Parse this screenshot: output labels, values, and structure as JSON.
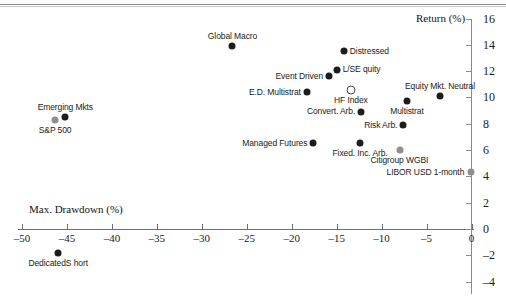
{
  "chart_data": {
    "type": "scatter",
    "title": "",
    "xlabel": "Max. Drawdown (%)",
    "ylabel": "Return (%)",
    "xlim": [
      -52,
      1
    ],
    "ylim": [
      -4,
      16
    ],
    "xticks": [
      -50,
      -45,
      -40,
      -35,
      -30,
      -25,
      -20,
      -15,
      -10,
      -5,
      0
    ],
    "yticks": [
      -4,
      -2,
      0,
      2,
      4,
      6,
      8,
      10,
      12,
      14,
      16
    ],
    "grid": false,
    "legend": "none",
    "y_axis_position": "right",
    "points": [
      {
        "label": "Global Macro",
        "x": -26.6,
        "y": 13.9,
        "marker": "black",
        "label_pos": "above"
      },
      {
        "label": "Distressed",
        "x": -14.2,
        "y": 13.5,
        "marker": "black",
        "label_pos": "right"
      },
      {
        "label": "L/SE quity",
        "x": -15.0,
        "y": 12.1,
        "marker": "black",
        "label_pos": "right"
      },
      {
        "label": "Event Driven",
        "x": -15.9,
        "y": 11.6,
        "marker": "black",
        "label_pos": "left"
      },
      {
        "label": "Equity Mkt. Neutral",
        "x": -3.5,
        "y": 10.1,
        "marker": "black",
        "label_pos": "above"
      },
      {
        "label": "E.D. Multistrat",
        "x": -18.3,
        "y": 10.4,
        "marker": "black",
        "label_pos": "left"
      },
      {
        "label": "HF Index",
        "x": -13.4,
        "y": 10.6,
        "marker": "hollow",
        "label_pos": "below"
      },
      {
        "label": "Multistrat",
        "x": -7.2,
        "y": 9.7,
        "marker": "black",
        "label_pos": "below"
      },
      {
        "label": "Convert. Arb.",
        "x": -12.3,
        "y": 8.9,
        "marker": "black",
        "label_pos": "left"
      },
      {
        "label": "Emerging Mkts",
        "x": -45.2,
        "y": 8.5,
        "marker": "black",
        "label_pos": "above"
      },
      {
        "label": "S&P 500",
        "x": -46.3,
        "y": 8.3,
        "marker": "gray",
        "label_pos": "below"
      },
      {
        "label": "Risk Arb.",
        "x": -7.6,
        "y": 7.9,
        "marker": "black",
        "label_pos": "left"
      },
      {
        "label": "Managed Futures",
        "x": -17.6,
        "y": 6.5,
        "marker": "black",
        "label_pos": "left"
      },
      {
        "label": "Fixed. Inc. Arb.",
        "x": -12.4,
        "y": 6.5,
        "marker": "black",
        "label_pos": "below"
      },
      {
        "label": "Citigroup WGBI",
        "x": -8.0,
        "y": 6.0,
        "marker": "gray",
        "label_pos": "below"
      },
      {
        "label": "LIBOR USD 1-month",
        "x": -0.1,
        "y": 4.3,
        "marker": "gray",
        "label_pos": "left"
      },
      {
        "label": "DedicatedS hort",
        "x": -46.0,
        "y": -1.8,
        "marker": "black",
        "label_pos": "below"
      }
    ]
  }
}
